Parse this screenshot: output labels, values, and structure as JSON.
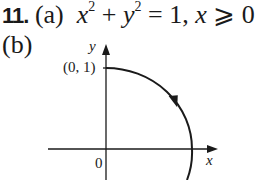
{
  "problem": {
    "number": "11.",
    "part_a_label": "(a)",
    "part_a_equation": {
      "x": "x",
      "exp1": "2",
      "plus": " + ",
      "y": "y",
      "exp2": "2",
      "rest": " = 1, ",
      "x2": "x",
      "cond": " ⩾ 0"
    },
    "part_b_label": "(b)"
  },
  "graph": {
    "y_axis_label": "y",
    "x_axis_label": "x",
    "origin_label": "0",
    "point_label": "(0, 1)",
    "curve": "quarter-to-half circle, clockwise from (0,1) through (1,0)"
  }
}
